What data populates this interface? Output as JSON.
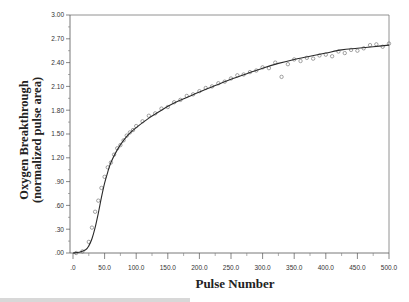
{
  "chart_data": {
    "type": "line",
    "title": "",
    "xlabel": "Pulse Number",
    "ylabel": [
      "Oxygen Breakthrough",
      "(normalized pulse area)"
    ],
    "xlim": [
      -5,
      500
    ],
    "ylim": [
      0,
      3.0
    ],
    "x_ticks": [
      0,
      50,
      100,
      150,
      200,
      250,
      300,
      350,
      400,
      450,
      500
    ],
    "x_tick_labels": [
      ".0",
      "50.0",
      "100.0",
      "150.0",
      "200.0",
      "250.0",
      "300.0",
      "350.0",
      "400.0",
      "450.0",
      "500.0"
    ],
    "y_ticks": [
      0,
      0.3,
      0.6,
      0.9,
      1.2,
      1.5,
      1.8,
      2.1,
      2.4,
      2.7,
      3.0
    ],
    "y_tick_labels": [
      ".00",
      ".30",
      ".60",
      ".90",
      "1.20",
      "1.50",
      "1.80",
      "2.10",
      "2.40",
      "2.70",
      "3.00"
    ],
    "grid": false,
    "legend": null,
    "series": [
      {
        "name": "model fit",
        "style": "solid-line",
        "x": [
          0,
          10,
          20,
          25,
          30,
          35,
          40,
          45,
          50,
          55,
          60,
          70,
          80,
          90,
          100,
          120,
          140,
          160,
          180,
          200,
          225,
          250,
          275,
          300,
          325,
          350,
          375,
          400,
          425,
          450,
          475,
          500
        ],
        "y": [
          0.0,
          0.01,
          0.04,
          0.09,
          0.18,
          0.32,
          0.5,
          0.7,
          0.88,
          1.02,
          1.14,
          1.3,
          1.42,
          1.51,
          1.58,
          1.7,
          1.8,
          1.89,
          1.96,
          2.03,
          2.11,
          2.19,
          2.26,
          2.33,
          2.39,
          2.44,
          2.48,
          2.52,
          2.56,
          2.58,
          2.6,
          2.62
        ]
      },
      {
        "name": "experimental data",
        "style": "open-circles",
        "x": [
          5,
          15,
          25,
          30,
          35,
          40,
          45,
          50,
          55,
          60,
          65,
          70,
          75,
          80,
          85,
          90,
          95,
          100,
          110,
          120,
          130,
          140,
          150,
          160,
          170,
          180,
          190,
          200,
          210,
          220,
          230,
          240,
          250,
          260,
          270,
          280,
          290,
          300,
          310,
          320,
          330,
          340,
          350,
          360,
          370,
          380,
          390,
          400,
          410,
          420,
          430,
          440,
          450,
          460,
          470,
          480,
          490,
          500
        ],
        "y": [
          0.0,
          0.02,
          0.14,
          0.32,
          0.52,
          0.66,
          0.82,
          0.96,
          1.08,
          1.14,
          1.24,
          1.32,
          1.36,
          1.42,
          1.48,
          1.52,
          1.55,
          1.6,
          1.66,
          1.73,
          1.76,
          1.82,
          1.84,
          1.9,
          1.93,
          1.98,
          2.0,
          2.04,
          2.08,
          2.1,
          2.14,
          2.16,
          2.2,
          2.24,
          2.25,
          2.28,
          2.3,
          2.34,
          2.33,
          2.4,
          2.22,
          2.38,
          2.44,
          2.42,
          2.46,
          2.45,
          2.49,
          2.5,
          2.48,
          2.54,
          2.52,
          2.56,
          2.55,
          2.58,
          2.62,
          2.63,
          2.6,
          2.64
        ]
      }
    ]
  },
  "caption": {
    "visible_text": ""
  }
}
